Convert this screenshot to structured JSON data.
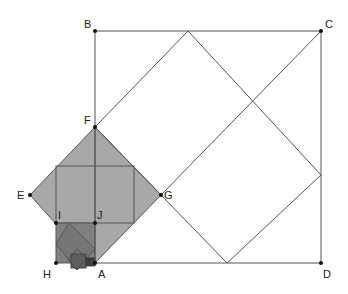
{
  "diagram": {
    "type": "geometric-construction",
    "colors": {
      "line": "#555555",
      "point": "#111111",
      "fill_light": "#a8a8a8",
      "fill_mid": "#8a8a8a",
      "fill_dark": "#6a6a6a",
      "fill_darkest": "#4a4a4a",
      "background": "#ffffff"
    },
    "points": [
      {
        "label": "A",
        "x": 95,
        "y": 263,
        "lx": 98,
        "ly": 278
      },
      {
        "label": "B",
        "x": 95,
        "y": 31,
        "lx": 84,
        "ly": 28
      },
      {
        "label": "C",
        "x": 321,
        "y": 31,
        "lx": 325,
        "ly": 28
      },
      {
        "label": "D",
        "x": 321,
        "y": 263,
        "lx": 323,
        "ly": 278
      },
      {
        "label": "E",
        "x": 30,
        "y": 195,
        "lx": 17,
        "ly": 199
      },
      {
        "label": "F",
        "x": 95,
        "y": 127,
        "lx": 84,
        "ly": 124
      },
      {
        "label": "G",
        "x": 161,
        "y": 195,
        "lx": 164,
        "ly": 199
      },
      {
        "label": "H",
        "x": 56,
        "y": 263,
        "lx": 43,
        "ly": 278
      },
      {
        "label": "I",
        "x": 56,
        "y": 223,
        "lx": 58,
        "ly": 219
      },
      {
        "label": "J",
        "x": 95,
        "y": 223,
        "lx": 97,
        "ly": 219
      }
    ],
    "outer_square": "A-B-C-D",
    "rotated_square_in_outer": [
      [
        95,
        127
      ],
      [
        188,
        31
      ],
      [
        321,
        175
      ],
      [
        227,
        263
      ]
    ],
    "gray_diamond": "E-F-G-A",
    "square_in_diamond": [
      [
        56,
        166
      ],
      [
        134,
        166
      ],
      [
        134,
        223
      ],
      [
        56,
        223
      ]
    ],
    "small_square": "H-I-J-A",
    "diamond_in_small_square": [
      [
        69,
        223
      ],
      [
        95,
        249
      ],
      [
        75,
        270
      ],
      [
        56,
        244
      ]
    ],
    "tiny_square": [
      [
        71,
        255
      ],
      [
        86,
        255
      ],
      [
        86,
        268
      ],
      [
        71,
        268
      ]
    ],
    "tiniest_square": [
      [
        86,
        258
      ],
      [
        95,
        258
      ],
      [
        95,
        266
      ],
      [
        86,
        266
      ]
    ]
  }
}
